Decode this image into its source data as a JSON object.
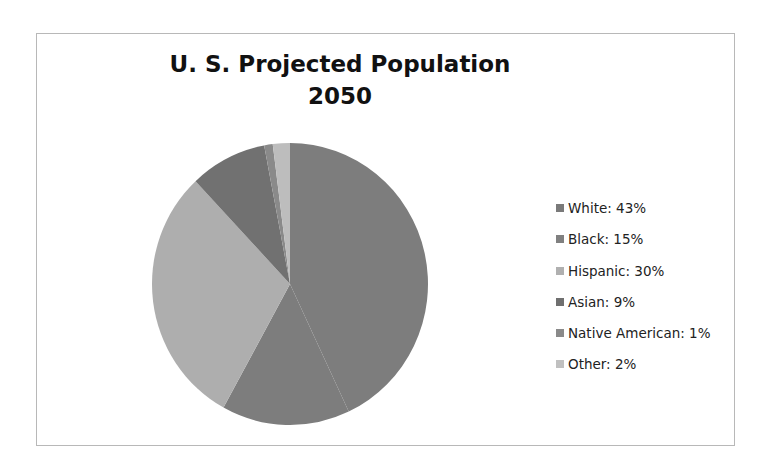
{
  "chart_data": {
    "type": "pie",
    "title": "U. S. Projected Population 2050",
    "title_lines": [
      "U. S. Projected Population",
      "2050"
    ],
    "categories": [
      "White",
      "Black",
      "Hispanic",
      "Asian",
      "Native American",
      "Other"
    ],
    "values": [
      43,
      15,
      30,
      9,
      1,
      2
    ],
    "unit": "%",
    "legend_position": "right",
    "legend": [
      {
        "label": "White:  43%",
        "color": "#7a7a7a"
      },
      {
        "label": "Black:  15%",
        "color": "#808080"
      },
      {
        "label": "Hispanic:  30%",
        "color": "#b0b0b0"
      },
      {
        "label": "Asian:  9%",
        "color": "#6f6f6f"
      },
      {
        "label": "Native American:  1%",
        "color": "#8a8a8a"
      },
      {
        "label": "Other:  2%",
        "color": "#c0c0c0"
      }
    ],
    "slice_colors": [
      "#7d7d7d",
      "#7d7d7d",
      "#aeaeae",
      "#717171",
      "#8a8a8a",
      "#bdbdbd"
    ]
  }
}
